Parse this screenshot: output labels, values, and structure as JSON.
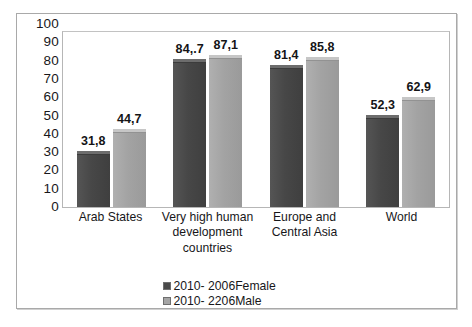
{
  "chart_data": {
    "type": "bar",
    "title": "",
    "subtitle": "",
    "xlabel": "",
    "ylabel": "",
    "ylim": [
      0,
      100
    ],
    "grid": false,
    "legend_position": "bottom",
    "y_ticks": [
      "100",
      "90",
      "80",
      "70",
      "60",
      "50",
      "40",
      "30",
      "20",
      "10",
      "0"
    ],
    "categories": [
      "Arab States",
      "Very high human development countries",
      "Europe and Central Asia",
      "World"
    ],
    "series": [
      {
        "name": "2010- 2006Female",
        "color": "#4a4a4a",
        "values": [
          31.8,
          84.7,
          81.4,
          52.3
        ],
        "labels": [
          "31,8",
          "84,.7",
          "81,4",
          "52,3"
        ]
      },
      {
        "name": "2010- 2206Male",
        "color": "#a5a5a5",
        "values": [
          44.7,
          87.1,
          85.8,
          62.9
        ],
        "labels": [
          "44,7",
          "87,1",
          "85,8",
          "62,9"
        ]
      }
    ]
  },
  "axis": {
    "y_ticks": [
      "100",
      "90",
      "80",
      "70",
      "60",
      "50",
      "40",
      "30",
      "20",
      "10",
      "0"
    ]
  },
  "categories": [
    {
      "line1": "Arab States",
      "line2": "",
      "line3": ""
    },
    {
      "line1": "Very high human",
      "line2": "development",
      "line3": "countries"
    },
    {
      "line1": "Europe and",
      "line2": "Central Asia",
      "line3": ""
    },
    {
      "line1": "World",
      "line2": "",
      "line3": ""
    }
  ],
  "legend": {
    "items": [
      {
        "label": "2010- 2006Female",
        "color": "#4a4a4a"
      },
      {
        "label": "2010- 2206Male",
        "color": "#a5a5a5"
      }
    ]
  }
}
